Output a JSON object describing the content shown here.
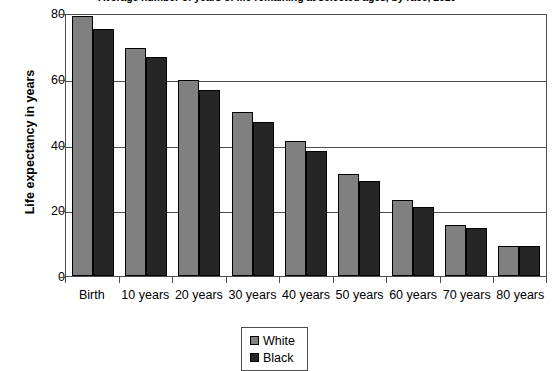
{
  "chart_data": {
    "type": "bar",
    "title": "Average number of years of life remaining at selected ages, by race, 2010",
    "xlabel": "",
    "ylabel": "Life expectancy in years",
    "ylim": [
      0,
      80
    ],
    "yticks": [
      0,
      20,
      40,
      60,
      80
    ],
    "grid": true,
    "legend_position": "bottom",
    "categories": [
      "Birth",
      "10 years",
      "20 years",
      "30 years",
      "40 years",
      "50 years",
      "60 years",
      "70 years",
      "80 years"
    ],
    "series": [
      {
        "name": "White",
        "color": "#808080",
        "values": [
          79,
          69.5,
          59.5,
          50,
          41,
          31,
          23,
          15.5,
          9
        ]
      },
      {
        "name": "Black",
        "color": "#262626",
        "values": [
          75,
          66.5,
          56.5,
          47,
          38,
          29,
          21,
          14.5,
          9
        ]
      }
    ]
  },
  "axis": {
    "y_tick_labels": [
      "80",
      "60",
      "40",
      "20",
      "0"
    ]
  },
  "legend": {
    "entries": [
      {
        "label": "White"
      },
      {
        "label": "Black"
      }
    ]
  }
}
